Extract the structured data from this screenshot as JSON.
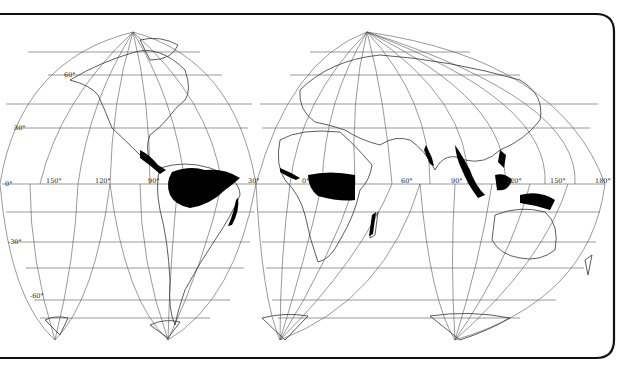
{
  "map": {
    "title": "Tropical rainforest distribution",
    "projection": "interrupted homolosine",
    "colors": {
      "background": "#ffffff",
      "land_outline": "#333333",
      "graticule": "#555555",
      "rainforest": "#000000",
      "frame": "#111111"
    },
    "latitude_labels": [
      "60°",
      "30°",
      "0°",
      "-30°",
      "-60°"
    ],
    "longitude_labels": [
      "150°",
      "120°",
      "90°",
      "30°",
      "0°",
      "60°",
      "90°",
      "120°",
      "150°",
      "180°"
    ],
    "legend": {
      "rainforest": "Tropical rainforest"
    }
  }
}
